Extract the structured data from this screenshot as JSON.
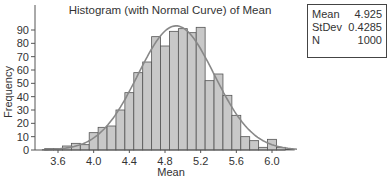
{
  "chart_data": {
    "type": "bar",
    "title": "Histogram (with Normal Curve) of Mean",
    "xlabel": "Mean",
    "ylabel": "Frequency",
    "xlim": [
      3.45,
      6.3
    ],
    "ylim": [
      0,
      100
    ],
    "x_ticks": [
      3.6,
      4.0,
      4.4,
      4.8,
      5.2,
      5.6,
      6.0
    ],
    "x_tick_labels": [
      "3.6",
      "4.0",
      "4.4",
      "4.8",
      "5.2",
      "5.6",
      "6.0"
    ],
    "y_ticks": [
      0,
      10,
      20,
      30,
      40,
      50,
      60,
      70,
      80,
      90
    ],
    "y_tick_labels": [
      "0",
      "10",
      "20",
      "30",
      "40",
      "50",
      "60",
      "70",
      "80",
      "90"
    ],
    "bin_width": 0.1,
    "bin_centers": [
      3.5,
      3.6,
      3.7,
      3.8,
      3.9,
      4.0,
      4.1,
      4.2,
      4.3,
      4.4,
      4.5,
      4.6,
      4.7,
      4.8,
      4.9,
      5.0,
      5.1,
      5.2,
      5.3,
      5.4,
      5.5,
      5.6,
      5.7,
      5.8,
      5.9,
      6.0,
      6.1,
      6.2
    ],
    "values": [
      1,
      1,
      3,
      5,
      4,
      13,
      17,
      18,
      30,
      43,
      58,
      66,
      85,
      78,
      89,
      91,
      88,
      92,
      52,
      57,
      41,
      26,
      10,
      7,
      2,
      8,
      2,
      0.5
    ],
    "overlay": {
      "type": "normal_curve",
      "mean": 4.925,
      "stdev": 0.4285,
      "n": 1000
    },
    "grid": false,
    "legend": null
  },
  "stats": {
    "rows": [
      {
        "label": "Mean",
        "value": "4.925"
      },
      {
        "label": "StDev",
        "value": "0.4285"
      },
      {
        "label": "N",
        "value": "1000"
      }
    ]
  },
  "colors": {
    "bar_fill": "#c8c8c8",
    "bar_stroke": "#555555",
    "curve": "#888888",
    "axis": "#555555",
    "text": "#333333"
  }
}
